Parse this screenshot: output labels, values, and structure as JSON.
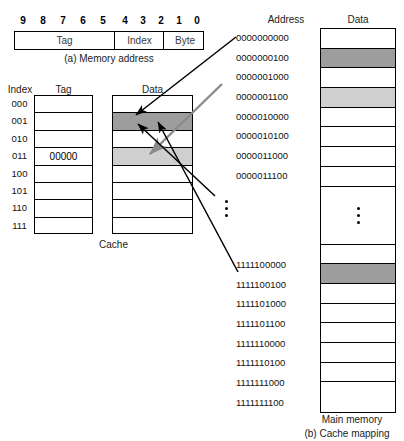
{
  "figure": {
    "caption_a": "(a) Memory address",
    "caption_b": "(b) Cache mapping",
    "cache_caption": "Cache",
    "main_memory_caption": "Main memory"
  },
  "memory_address": {
    "bit_numbers": [
      "9",
      "8",
      "7",
      "6",
      "5",
      "4",
      "3",
      "2",
      "1",
      "0"
    ],
    "fields": [
      {
        "name": "tag",
        "label": "Tag",
        "bits": "9-5"
      },
      {
        "name": "index",
        "label": "Index",
        "bits": "4-2"
      },
      {
        "name": "byte",
        "label": "Byte",
        "bits": "1-0"
      }
    ]
  },
  "cache": {
    "headers": {
      "index": "Index",
      "tag": "Tag",
      "data": "Data"
    },
    "rows": [
      {
        "index": "000",
        "tag": "",
        "data": "",
        "fill": "none"
      },
      {
        "index": "001",
        "tag": "",
        "data": "",
        "fill": "dark"
      },
      {
        "index": "010",
        "tag": "",
        "data": "",
        "fill": "none"
      },
      {
        "index": "011",
        "tag": "00000",
        "data": "",
        "fill": "light"
      },
      {
        "index": "100",
        "tag": "",
        "data": "",
        "fill": "none"
      },
      {
        "index": "101",
        "tag": "",
        "data": "",
        "fill": "none"
      },
      {
        "index": "110",
        "tag": "",
        "data": "",
        "fill": "none"
      },
      {
        "index": "111",
        "tag": "",
        "data": "",
        "fill": "none"
      }
    ]
  },
  "main_memory": {
    "headers": {
      "address": "Address",
      "data": "Data"
    },
    "rows_top": [
      {
        "address": "0000000000",
        "fill": "none"
      },
      {
        "address": "0000000100",
        "fill": "dark"
      },
      {
        "address": "0000001000",
        "fill": "none"
      },
      {
        "address": "0000001100",
        "fill": "light"
      },
      {
        "address": "0000010000",
        "fill": "none"
      },
      {
        "address": "0000010100",
        "fill": "none"
      },
      {
        "address": "0000011000",
        "fill": "none"
      },
      {
        "address": "0000011100",
        "fill": "none"
      }
    ],
    "rows_bottom": [
      {
        "address": "1111100000",
        "fill": "none"
      },
      {
        "address": "1111100100",
        "fill": "dark"
      },
      {
        "address": "1111101000",
        "fill": "none"
      },
      {
        "address": "1111101100",
        "fill": "none"
      },
      {
        "address": "1111110000",
        "fill": "none"
      },
      {
        "address": "1111110100",
        "fill": "none"
      },
      {
        "address": "1111111000",
        "fill": "none"
      },
      {
        "address": "1111111100",
        "fill": "none"
      }
    ],
    "ellipsis": "vertical-dots"
  },
  "colors": {
    "fill_dark": "#9d9d9d",
    "fill_light": "#cfcfcf",
    "line": "#000000",
    "arrow_gray": "#8a8a8a",
    "background": "#ffffff"
  }
}
